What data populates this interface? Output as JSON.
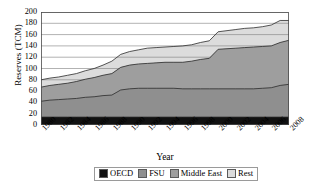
{
  "chart_data": {
    "type": "area",
    "stacked": true,
    "title": "",
    "xlabel": "Year",
    "ylabel": "Reserves (TCM)",
    "xlim": [
      1980,
      2008
    ],
    "ylim": [
      0,
      200
    ],
    "ytick_labels": [
      "0",
      "20",
      "40",
      "60",
      "80",
      "100",
      "120",
      "140",
      "160",
      "180",
      "200"
    ],
    "ytick_values": [
      0,
      20,
      40,
      60,
      80,
      100,
      120,
      140,
      160,
      180,
      200
    ],
    "xtick_labels": [
      "1980",
      "1982",
      "1984",
      "1986",
      "1988",
      "1990",
      "1992",
      "1994",
      "1996",
      "1998",
      "2000",
      "2002",
      "2004",
      "2006",
      "2008"
    ],
    "xtick_values": [
      1980,
      1982,
      1984,
      1986,
      1988,
      1990,
      1992,
      1994,
      1996,
      1998,
      2000,
      2002,
      2004,
      2006,
      2008
    ],
    "grid": "horizontal",
    "legend_position": "bottom",
    "x": [
      1980,
      1981,
      1982,
      1983,
      1984,
      1985,
      1986,
      1987,
      1988,
      1989,
      1990,
      1991,
      1992,
      1993,
      1994,
      1995,
      1996,
      1997,
      1998,
      1999,
      2000,
      2001,
      2002,
      2003,
      2004,
      2005,
      2006,
      2007,
      2008
    ],
    "series": [
      {
        "name": "OECD",
        "color": "#111111",
        "values": [
          14,
          14,
          14,
          14,
          14,
          14,
          14,
          14,
          14,
          14,
          14,
          14,
          14,
          14,
          14,
          14,
          14,
          14,
          14,
          14,
          14,
          14,
          14,
          14,
          14,
          14,
          14,
          14,
          14
        ]
      },
      {
        "name": "FSU",
        "color": "#8f8f8f",
        "values": [
          28,
          30,
          31,
          32,
          33,
          35,
          36,
          38,
          39,
          48,
          50,
          51,
          51,
          51,
          51,
          51,
          50,
          50,
          50,
          50,
          50,
          50,
          50,
          50,
          50,
          51,
          52,
          56,
          58
        ]
      },
      {
        "name": "Middle East",
        "color": "#9e9e9e",
        "values": [
          25,
          26,
          27,
          28,
          30,
          32,
          34,
          36,
          38,
          40,
          42,
          43,
          44,
          45,
          46,
          46,
          47,
          49,
          52,
          54,
          70,
          71,
          72,
          73,
          74,
          74,
          74,
          76,
          78
        ]
      },
      {
        "name": "Rest",
        "color": "#dcdcdc",
        "values": [
          13,
          13,
          13,
          14,
          14,
          15,
          16,
          18,
          22,
          23,
          24,
          25,
          27,
          27,
          27,
          28,
          29,
          29,
          30,
          31,
          31,
          32,
          33,
          34,
          34,
          35,
          37,
          39,
          35
        ]
      }
    ],
    "cumulative_tops": {
      "oecd": [
        14,
        14,
        14,
        14,
        14,
        14,
        14,
        14,
        14,
        14,
        14,
        14,
        14,
        14,
        14,
        14,
        14,
        14,
        14,
        14,
        14,
        14,
        14,
        14,
        14,
        14,
        14,
        14,
        14
      ],
      "fsu": [
        42,
        44,
        45,
        46,
        47,
        49,
        50,
        52,
        53,
        62,
        64,
        65,
        65,
        65,
        65,
        65,
        64,
        64,
        64,
        64,
        64,
        64,
        64,
        64,
        64,
        65,
        66,
        70,
        72
      ],
      "middle_east": [
        67,
        70,
        72,
        74,
        77,
        81,
        84,
        88,
        91,
        102,
        106,
        108,
        109,
        110,
        111,
        111,
        111,
        113,
        116,
        118,
        134,
        135,
        136,
        137,
        138,
        139,
        140,
        146,
        150
      ],
      "total": [
        80,
        83,
        85,
        88,
        91,
        96,
        100,
        106,
        113,
        125,
        130,
        133,
        136,
        137,
        138,
        139,
        140,
        142,
        146,
        149,
        165,
        167,
        169,
        171,
        172,
        174,
        177,
        185,
        185
      ]
    }
  },
  "axes": {
    "y_title": "Reserves (TCM)",
    "x_title": "Year"
  },
  "legend": {
    "items": [
      {
        "label": "OECD",
        "color": "#111111"
      },
      {
        "label": "FSU",
        "color": "#8f8f8f"
      },
      {
        "label": "Middle East",
        "color": "#9e9e9e"
      },
      {
        "label": "Rest",
        "color": "#dcdcdc"
      }
    ]
  }
}
